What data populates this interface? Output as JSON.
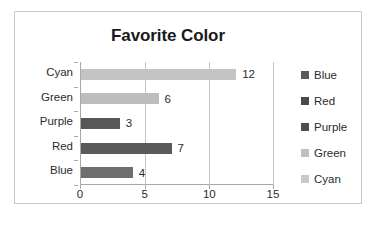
{
  "chart_data": {
    "type": "bar",
    "orientation": "horizontal",
    "title": "Favorite Color",
    "xlabel": "",
    "ylabel": "",
    "categories": [
      "Blue",
      "Red",
      "Purple",
      "Green",
      "Cyan"
    ],
    "values": [
      4,
      7,
      3,
      6,
      12
    ],
    "data_labels": [
      "4",
      "7",
      "3",
      "6",
      "12"
    ],
    "xlim": [
      0,
      15
    ],
    "xticks": [
      "0",
      "5",
      "10",
      "15"
    ],
    "grid": true,
    "legend_position": "right",
    "legend": [
      {
        "label": "Blue",
        "color": "#595959"
      },
      {
        "label": "Red",
        "color": "#4a4a4a"
      },
      {
        "label": "Purple",
        "color": "#4f4f4f"
      },
      {
        "label": "Green",
        "color": "#bfbfbf"
      },
      {
        "label": "Cyan",
        "color": "#c9c9c9"
      }
    ],
    "bar_colors": {
      "Blue": "#6e6e6e",
      "Red": "#5a5a5a",
      "Purple": "#575757",
      "Green": "#bdbdbd",
      "Cyan": "#c4c4c4"
    },
    "plot_background": "#ffffff",
    "border_color": "#c9c9c9",
    "axis_color": "#a8a8a8",
    "gridline_color": "#c5c5c5",
    "text_color": "#2b2b2b"
  }
}
